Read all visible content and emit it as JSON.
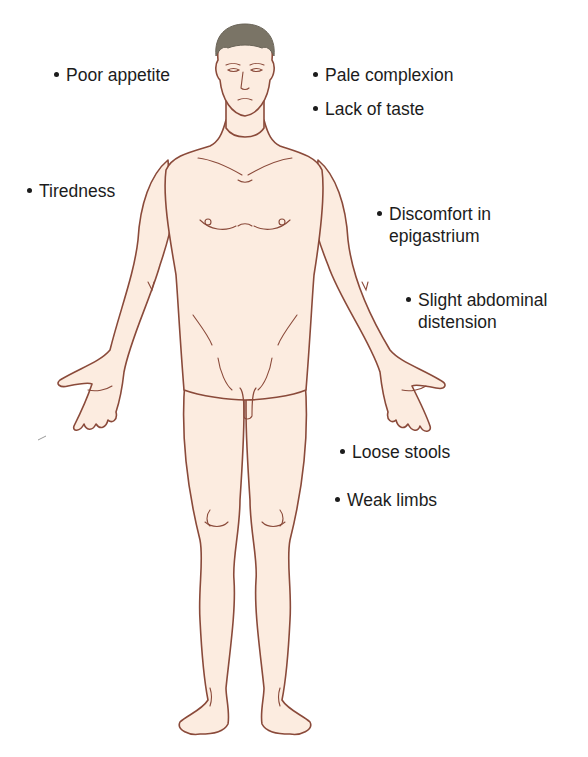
{
  "diagram": {
    "colors": {
      "skin": "#fcece0",
      "outline": "#8a4a3a",
      "hair": "#7a7466",
      "text": "#1c1c1c"
    }
  },
  "labels": [
    {
      "id": "poor-appetite",
      "line1": "Poor appetite",
      "line2": ""
    },
    {
      "id": "pale-complexion",
      "line1": "Pale complexion",
      "line2": ""
    },
    {
      "id": "lack-of-taste",
      "line1": "Lack of taste",
      "line2": ""
    },
    {
      "id": "tiredness",
      "line1": "Tiredness",
      "line2": ""
    },
    {
      "id": "discomfort-epigastrium",
      "line1": "Discomfort in",
      "line2": "epigastrium"
    },
    {
      "id": "slight-abdominal-distension",
      "line1": "Slight abdominal",
      "line2": "distension"
    },
    {
      "id": "loose-stools",
      "line1": "Loose stools",
      "line2": ""
    },
    {
      "id": "weak-limbs",
      "line1": "Weak limbs",
      "line2": ""
    }
  ]
}
